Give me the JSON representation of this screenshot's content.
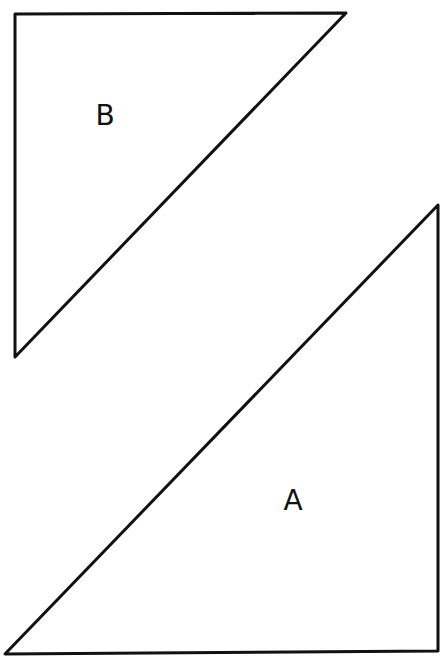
{
  "diagram": {
    "stroke_color": "#111111",
    "background": "#ffffff",
    "shapes": [
      {
        "id": "B",
        "label": "B",
        "type": "right-triangle",
        "points": [
          [
            15,
            14
          ],
          [
            346,
            13
          ],
          [
            15,
            357
          ]
        ],
        "label_pos": [
          105,
          125
        ]
      },
      {
        "id": "A",
        "label": "A",
        "type": "right-triangle",
        "points": [
          [
            438,
            205
          ],
          [
            438,
            651
          ],
          [
            5,
            654
          ]
        ],
        "label_pos": [
          293,
          510
        ]
      }
    ]
  }
}
